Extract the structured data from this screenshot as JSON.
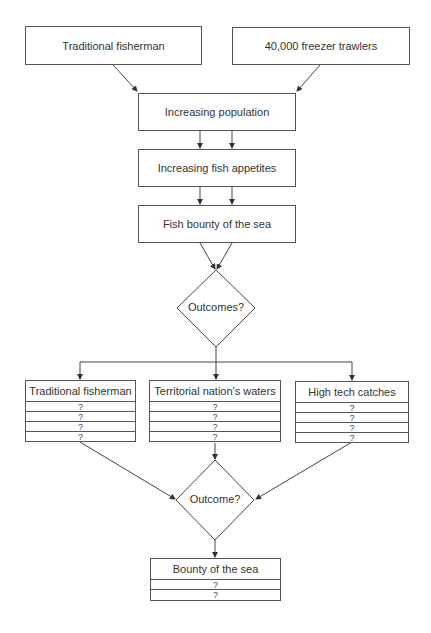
{
  "top_sources": [
    {
      "label": "Traditional fisherman"
    },
    {
      "label": "40,000 freezer trawlers"
    }
  ],
  "chain": [
    {
      "label": "Increasing population"
    },
    {
      "label": "Increasing fish appetites"
    },
    {
      "label": "Fish bounty of the sea"
    }
  ],
  "decision1": {
    "label": "Outcomes?"
  },
  "outcome_tables": [
    {
      "title": "Traditional fisherman",
      "rows": [
        "?",
        "?",
        "?",
        "?"
      ]
    },
    {
      "title": "Territorial nation's waters",
      "rows": [
        "?",
        "?",
        "?",
        "?"
      ]
    },
    {
      "title": "High tech catches",
      "rows": [
        "?",
        "?",
        "?",
        "?"
      ]
    }
  ],
  "decision2": {
    "label": "Outcome?"
  },
  "final_table": {
    "title": "Bounty of the sea",
    "rows": [
      "?",
      "?"
    ]
  }
}
